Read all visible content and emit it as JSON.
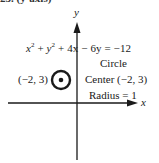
{
  "header": {
    "label": "25. (y-axis)"
  },
  "diagram": {
    "axes": {
      "x_label": "x",
      "y_label": "y"
    },
    "equation": "x² + y² + 4x − 6y = −12",
    "equation_parts": {
      "t1": "x",
      "t1_exp": "2",
      "plus1": " + ",
      "t2": "y",
      "t2_exp": "2",
      "rest": " + 4x − 6y = −12"
    },
    "point_label": "(−2, 3)",
    "info": {
      "shape": "Circle",
      "center": "Center (−2, 3)",
      "radius": "Radius = 1"
    },
    "circle": {
      "center_x": -2,
      "center_y": 3,
      "radius": 1
    },
    "colors": {
      "ink": "#1a1a1a",
      "background": "#ffffff"
    }
  }
}
